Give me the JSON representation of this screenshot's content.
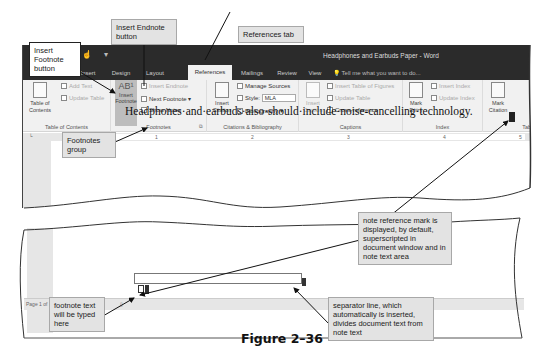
{
  "window": {
    "title": "Headphones and Earbuds Paper - Word",
    "quick_access_icons": [
      "undo-icon",
      "touch-mode-icon",
      "customize-icon"
    ]
  },
  "tabs": [
    {
      "label": "Insert",
      "active": false
    },
    {
      "label": "Design",
      "active": false
    },
    {
      "label": "Layout",
      "active": false
    },
    {
      "label": "References",
      "active": true
    },
    {
      "label": "Mailings",
      "active": false
    },
    {
      "label": "Review",
      "active": false
    },
    {
      "label": "View",
      "active": false
    }
  ],
  "tell_me": "Tell me what you want to do...",
  "ribbon": {
    "table_of_contents": {
      "group_label": "Table of Contents",
      "toc_button": "Table of Contents",
      "add_text": "Add Text",
      "update_table": "Update Table"
    },
    "footnotes": {
      "group_label": "Footnotes",
      "insert_footnote": "Insert Footnote",
      "insert_footnote_glyph": "AB¹",
      "insert_endnote": "Insert Endnote",
      "next_footnote": "Next Footnote",
      "show_notes": "Show Notes"
    },
    "citations": {
      "group_label": "Citations & Bibliography",
      "insert_citation": "Insert Citation",
      "manage_sources": "Manage Sources",
      "style_label": "Style:",
      "style_value": "MLA",
      "bibliography": "Bibliography"
    },
    "captions": {
      "group_label": "Captions",
      "insert_caption": "Insert Caption",
      "insert_table_of_figures": "Insert Table of Figures",
      "update_table": "Update Table",
      "cross_reference": "Cross-reference"
    },
    "index": {
      "group_label": "Index",
      "mark_entry": "Mark Entry",
      "insert_index": "Insert Index",
      "update_index": "Update Index"
    },
    "table_of_authorities": {
      "group_label": "Tab",
      "mark_citation": "Mark Citation"
    }
  },
  "ruler": {
    "marks": [
      "1",
      "2",
      "3",
      "4",
      "5"
    ]
  },
  "document": {
    "text": "Headphones·and·earbuds·also·should·include·noise-cancelling·technology."
  },
  "status_bar": {
    "page": "Page 1 of"
  },
  "callouts": {
    "insert_endnote": "Insert Endnote button",
    "references_tab": "References tab",
    "insert_footnote": "Insert Footnote button",
    "footnotes_group": "Footnotes group",
    "note_reference": "note reference mark is displayed, by default, superscripted in document window and in note text area",
    "footnote_text": "footnote text will be typed here",
    "separator": "separator line, which automatically is inserted, divides document text from note text"
  },
  "figure_caption": "Figure 2–36"
}
